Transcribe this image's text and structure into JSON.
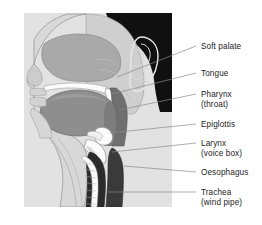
{
  "figure": {
    "background_color": "#ffffff",
    "panel_color": "#e2e2e2",
    "panel": {
      "x": 24,
      "y": 13,
      "width": 148,
      "height": 194
    }
  },
  "colors": {
    "hair_black": "#101010",
    "skin_light": "#d8d8d8",
    "skin_mid": "#c4c4c4",
    "nasal_cavity": "#a9a9a9",
    "tongue_gray": "#8e8e8e",
    "pharynx_dark": "#6f6f6f",
    "trachea_dark": "#2b2b2b",
    "oesophagus_dark": "#3a3a3a",
    "highlight_white": "#fbfbfb",
    "outline": "#6e6e6e",
    "leader": "#8a8a8a",
    "text": "#1c1c1c"
  },
  "labels": [
    {
      "id": "soft-palate",
      "text": "Soft palate",
      "sublabel": "",
      "text_x": 201,
      "text_y": 49,
      "leader": {
        "x1": 196,
        "y1": 46,
        "x2": 117,
        "y2": 77
      }
    },
    {
      "id": "tongue",
      "text": "Tongue",
      "sublabel": "",
      "text_x": 201,
      "text_y": 76,
      "leader": {
        "x1": 196,
        "y1": 73,
        "x2": 112,
        "y2": 94
      }
    },
    {
      "id": "pharynx",
      "text": "Pharynx",
      "sublabel": "(throat)",
      "text_x": 201,
      "text_y": 97,
      "sub_x": 201,
      "sub_y": 107,
      "leader": {
        "x1": 196,
        "y1": 94,
        "x2": 119,
        "y2": 110
      }
    },
    {
      "id": "epiglottis",
      "text": "Epiglottis",
      "sublabel": "",
      "text_x": 201,
      "text_y": 127,
      "leader": {
        "x1": 196,
        "y1": 124,
        "x2": 110,
        "y2": 133
      }
    },
    {
      "id": "larynx",
      "text": "Larynx",
      "sublabel": "(voice box)",
      "text_x": 201,
      "text_y": 146,
      "sub_x": 201,
      "sub_y": 156,
      "leader": {
        "x1": 196,
        "y1": 143,
        "x2": 112,
        "y2": 152
      }
    },
    {
      "id": "oesophagus",
      "text": "Oesophagus",
      "sublabel": "",
      "text_x": 201,
      "text_y": 175,
      "leader": {
        "x1": 196,
        "y1": 172,
        "x2": 124,
        "y2": 166
      }
    },
    {
      "id": "trachea",
      "text": "Trachea",
      "sublabel": "(wind pipe)",
      "text_x": 201,
      "text_y": 195,
      "sub_x": 201,
      "sub_y": 205,
      "leader": {
        "x1": 196,
        "y1": 192,
        "x2": 108,
        "y2": 192
      }
    }
  ]
}
